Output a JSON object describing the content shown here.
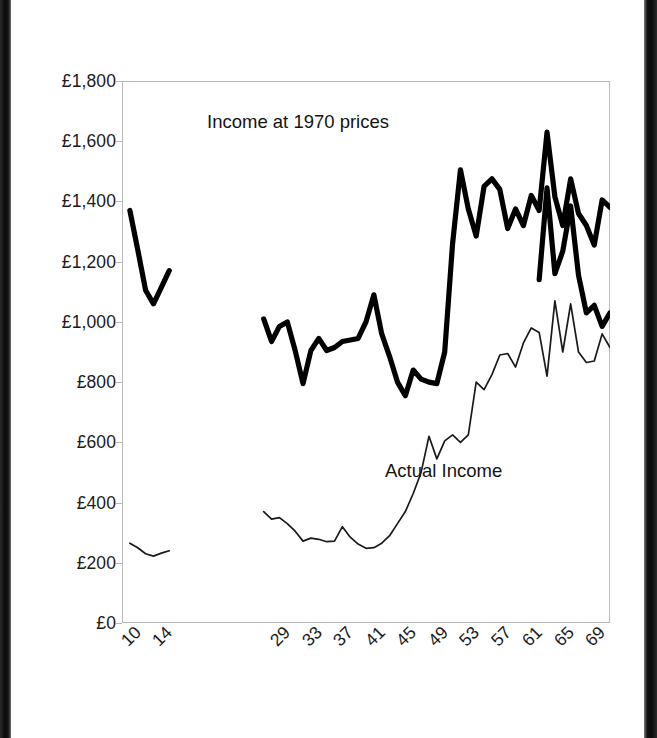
{
  "figure": {
    "background_color": "#ffffff",
    "ink_color": "#000000",
    "frame_color": "#b9b9b9",
    "scan_edge_color": "#0a0a0a"
  },
  "annotations": {
    "real_series_label": "Income at 1970 prices",
    "actual_series_label": "Actual Income"
  },
  "chart_data": {
    "type": "line",
    "title": "",
    "subtitle": "",
    "xlabel": "",
    "ylabel": "",
    "grid": false,
    "legend_position": "in-plot annotations",
    "ylim": [
      0,
      1800
    ],
    "y_tick_labels": [
      "£0",
      "£200",
      "£400",
      "£600",
      "£800",
      "£1,000",
      "£1,200",
      "£1,400",
      "£1,600",
      "£1,800"
    ],
    "y_tick_values": [
      0,
      200,
      400,
      600,
      800,
      1000,
      1200,
      1400,
      1600,
      1800
    ],
    "y_tick_prefix": "£",
    "x_tick_labels": [
      "10",
      "14",
      "29",
      "33",
      "37",
      "41",
      "45",
      "49",
      "53",
      "57",
      "61",
      "65",
      "69"
    ],
    "x_tick_values": [
      10,
      14,
      29,
      33,
      37,
      41,
      45,
      49,
      53,
      57,
      61,
      65,
      69
    ],
    "x_tick_rotation_deg": -45,
    "xlim": [
      9,
      71
    ],
    "series": [
      {
        "name": "Income at 1970 prices",
        "style": "thick-solid",
        "color": "#000000",
        "line_width": 5,
        "has_gap": true,
        "gap_between_x": [
          15,
          27
        ],
        "x": [
          10,
          11,
          12,
          13,
          14,
          15,
          27,
          28,
          29,
          30,
          31,
          32,
          33,
          34,
          35,
          36,
          37,
          38,
          39,
          40,
          41,
          42,
          43,
          44,
          45,
          46,
          47,
          48,
          49,
          50,
          51,
          52,
          53,
          54,
          55,
          56,
          57,
          58,
          59,
          60,
          61,
          62,
          63,
          64,
          65,
          66,
          67,
          68,
          69,
          70,
          71
        ],
        "values": [
          1370,
          1240,
          1105,
          1060,
          1115,
          1170,
          1010,
          935,
          985,
          1000,
          905,
          795,
          905,
          945,
          905,
          915,
          935,
          940,
          945,
          1000,
          1090,
          960,
          885,
          800,
          755,
          840,
          810,
          800,
          795,
          900,
          1260,
          1505,
          1375,
          1285,
          1450,
          1475,
          1440,
          1310,
          1375,
          1320,
          1420,
          1370,
          1630,
          1415,
          1320,
          1475,
          1360,
          1320,
          1255,
          1405,
          1380
        ]
      },
      {
        "name": "Income at 1970 prices (continued)",
        "style": "thick-solid",
        "color": "#000000",
        "line_width": 5,
        "continues": true,
        "x": [
          62,
          63,
          64,
          65,
          66,
          67,
          68,
          69,
          70,
          71
        ],
        "values": [
          1140,
          1445,
          1160,
          1235,
          1385,
          1155,
          1030,
          1055,
          985,
          1030
        ]
      },
      {
        "name": "Actual Income",
        "style": "thin-solid",
        "color": "#1a1a1a",
        "line_width": 1.6,
        "has_gap": true,
        "gap_between_x": [
          15,
          27
        ],
        "x": [
          10,
          11,
          12,
          13,
          14,
          15,
          27,
          28,
          29,
          30,
          31,
          32,
          33,
          34,
          35,
          36,
          37,
          38,
          39,
          40,
          41,
          42,
          43,
          44,
          45,
          46,
          47,
          48,
          49,
          50,
          51,
          52,
          53,
          54,
          55,
          56,
          57,
          58,
          59,
          60,
          61,
          62,
          63,
          64,
          65,
          66,
          67,
          68,
          69,
          70,
          71
        ],
        "values": [
          265,
          250,
          230,
          222,
          232,
          240,
          370,
          345,
          350,
          330,
          305,
          272,
          282,
          278,
          270,
          272,
          320,
          285,
          262,
          248,
          250,
          265,
          290,
          330,
          370,
          430,
          500,
          620,
          545,
          605,
          625,
          600,
          625,
          800,
          775,
          825,
          890,
          895,
          850,
          930,
          980,
          965,
          820,
          1070,
          900,
          1060,
          900,
          865,
          870,
          960,
          915
        ]
      }
    ]
  }
}
